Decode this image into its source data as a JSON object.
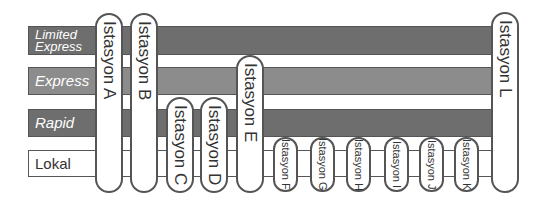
{
  "services": [
    {
      "label_lines": [
        "Limited",
        "Express"
      ],
      "color": "#6e6e6e",
      "top": 26,
      "height": 29
    },
    {
      "label_lines": [
        "Express"
      ],
      "color": "#8c8c8c",
      "top": 67,
      "height": 28
    },
    {
      "label_lines": [
        "Rapid"
      ],
      "color": "#6e6e6e",
      "top": 109,
      "height": 28
    },
    {
      "label_lines": [
        "Lokal"
      ],
      "color": "#ffffff",
      "top": 150,
      "height": 27
    }
  ],
  "stations": [
    {
      "name": "Istasyon A",
      "left": 95,
      "top": 13,
      "width": 28,
      "height": 180,
      "size": "big"
    },
    {
      "name": "Istasyon B",
      "left": 130,
      "top": 13,
      "width": 28,
      "height": 180,
      "size": "big"
    },
    {
      "name": "Istasyon C",
      "left": 166,
      "top": 97,
      "width": 28,
      "height": 96,
      "size": "big"
    },
    {
      "name": "Istasyon D",
      "left": 200,
      "top": 97,
      "width": 28,
      "height": 96,
      "size": "big"
    },
    {
      "name": "Istasyon E",
      "left": 236,
      "top": 55,
      "width": 28,
      "height": 138,
      "size": "big"
    },
    {
      "name": "Istasyon F",
      "left": 273,
      "top": 137,
      "width": 25,
      "height": 55,
      "size": "small"
    },
    {
      "name": "Istasyon G",
      "left": 310,
      "top": 137,
      "width": 25,
      "height": 55,
      "size": "small"
    },
    {
      "name": "Istasyon H",
      "left": 346,
      "top": 137,
      "width": 25,
      "height": 55,
      "size": "small"
    },
    {
      "name": "Istasyon I",
      "left": 384,
      "top": 137,
      "width": 25,
      "height": 55,
      "size": "small"
    },
    {
      "name": "Istasyon J",
      "left": 419,
      "top": 137,
      "width": 25,
      "height": 55,
      "size": "small"
    },
    {
      "name": "Istasyon K",
      "left": 454,
      "top": 137,
      "width": 25,
      "height": 55,
      "size": "small"
    },
    {
      "name": "Istasyon L",
      "left": 491,
      "top": 12,
      "width": 28,
      "height": 181,
      "size": "big"
    }
  ]
}
